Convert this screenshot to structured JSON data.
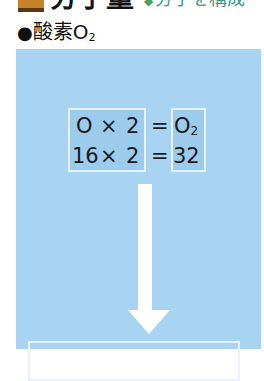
{
  "heading": {
    "title": "分子量",
    "subtitle_mark": "◆",
    "subtitle": "分子を構成"
  },
  "subhead": {
    "bullet": "●",
    "label": "酸素O",
    "subscript": "2"
  },
  "equation": {
    "row1": {
      "term": "O",
      "times": "×",
      "factor": "2",
      "equals": "=",
      "result": "O",
      "result_sub": "2"
    },
    "row2": {
      "term": "16",
      "times": "×",
      "factor": "2",
      "equals": "=",
      "result": "32"
    }
  },
  "colors": {
    "panel": "#a8d4f2",
    "box_border": "#e6f3fc",
    "heading_icon": "#c8822a",
    "subtitle": "#2f9e8f"
  }
}
